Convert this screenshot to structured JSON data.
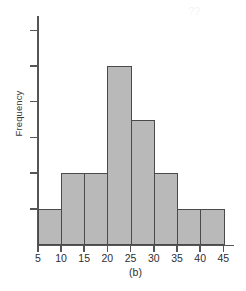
{
  "figure": {
    "caption": "(b)",
    "ylabel": "Frequency"
  },
  "colors": {
    "bar_fill": "#b9b9b9",
    "bar_stroke": "#4a4a4a",
    "axis": "#555555",
    "text": "#2e2e2e",
    "background": "#ffffff"
  },
  "chart_data": {
    "type": "bar",
    "title": "",
    "subtitle": "(b)",
    "xlabel": "",
    "ylabel": "Frequency",
    "orientation": "vertical",
    "grid": false,
    "legend": null,
    "histogram": true,
    "bin_width": 5,
    "bin_edges": [
      5,
      10,
      15,
      20,
      25,
      30,
      35,
      40,
      45
    ],
    "categories": [
      "5-10",
      "10-15",
      "15-20",
      "20-25",
      "25-30",
      "30-35",
      "35-40",
      "40-45"
    ],
    "values": [
      1,
      2,
      2,
      5,
      3.5,
      2,
      1,
      1
    ],
    "xtick_labels": [
      "5",
      "10",
      "15",
      "20",
      "25",
      "30",
      "35",
      "40",
      "45"
    ],
    "xtick_values": [
      5,
      10,
      15,
      20,
      25,
      30,
      35,
      40,
      45
    ],
    "ytick_labels": [
      "",
      "",
      "",
      "",
      "",
      ""
    ],
    "ytick_values": [
      1,
      2,
      3,
      4,
      5,
      6
    ],
    "xlim": [
      5,
      46
    ],
    "ylim": [
      0,
      6.4
    ],
    "y_axis_labeled": false,
    "n_yticks": 6
  },
  "speckle": "??"
}
